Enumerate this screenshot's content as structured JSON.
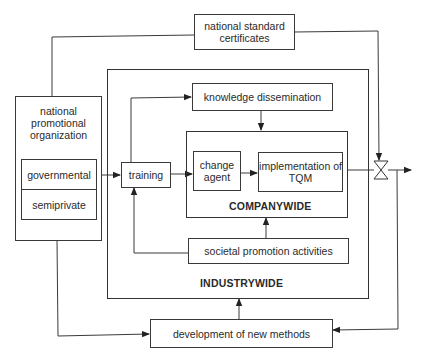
{
  "diagram": {
    "nodes": {
      "certificates": "national standard\ncertificates",
      "organization": "national\npromotional\norganization",
      "governmental": "governmental",
      "semiprivate": "semiprivate",
      "training": "training",
      "knowledge": "knowledge dissemination",
      "change_agent": "change\nagent",
      "tqm": "implementation of\nTQM",
      "societal": "societal promotion activities",
      "development": "development of new methods"
    },
    "regions": {
      "companywide": "COMPANYWIDE",
      "industrywide": "INDUSTRYWIDE"
    },
    "edges": [
      {
        "from": "certificates",
        "to": "organization",
        "arrow": false
      },
      {
        "from": "certificates",
        "to": "valve",
        "arrow": true
      },
      {
        "from": "governmental",
        "to": "training",
        "arrow": true
      },
      {
        "from": "training",
        "to": "knowledge",
        "arrow": true
      },
      {
        "from": "training",
        "to": "change_agent",
        "arrow": true
      },
      {
        "from": "knowledge",
        "to": "companywide",
        "arrow": true
      },
      {
        "from": "change_agent",
        "to": "tqm",
        "arrow": true
      },
      {
        "from": "tqm",
        "to": "valve",
        "arrow": false
      },
      {
        "from": "valve",
        "to": "output",
        "arrow": true
      },
      {
        "from": "societal",
        "to": "training",
        "arrow": true
      },
      {
        "from": "societal",
        "to": "companywide",
        "arrow": true
      },
      {
        "from": "organization",
        "to": "development",
        "arrow": true
      },
      {
        "from": "valve",
        "to": "development",
        "arrow": true
      },
      {
        "from": "development",
        "to": "industrywide",
        "arrow": true
      }
    ],
    "symbols": {
      "valve": "valve-symbol"
    }
  }
}
